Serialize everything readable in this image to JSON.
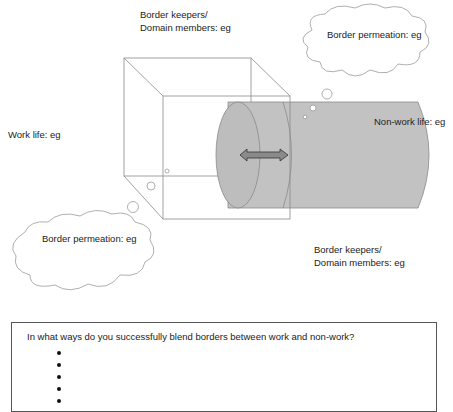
{
  "diagram": {
    "labels": {
      "border_keepers_top": [
        "Border keepers/",
        "Domain members: eg"
      ],
      "border_permeation_top": "Border permeation: eg",
      "work_life": "Work life: eg",
      "non_work_life": "Non-work life: eg",
      "border_permeation_bottom": "Border permeation: eg",
      "border_keepers_bottom": [
        "Border keepers/",
        "Domain members: eg"
      ]
    },
    "shapes": {
      "work_domain": "wireframe-cube",
      "non_work_domain": "grey-cylinder",
      "transition": "double-headed-arrow"
    },
    "colors": {
      "line": "#777777",
      "cylinder_fill": "#bdbdbd",
      "arrow_fill": "#8a8a8a"
    }
  },
  "question": {
    "prompt": "In what ways do you successfully blend borders between work and non-work?",
    "bullets": [
      "",
      "",
      "",
      "",
      ""
    ]
  }
}
